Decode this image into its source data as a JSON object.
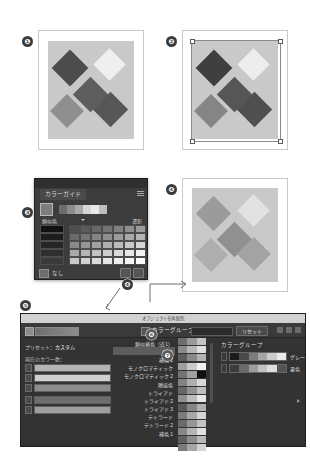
{
  "figure": {
    "callouts": [
      {
        "id": "1",
        "glyph": "❶"
      },
      {
        "id": "2",
        "glyph": "❷"
      },
      {
        "id": "3",
        "glyph": "❸"
      },
      {
        "id": "4",
        "glyph": "❹"
      },
      {
        "id": "5",
        "glyph": "❺"
      },
      {
        "id": "6",
        "glyph": "❻"
      },
      {
        "id": "7",
        "glyph": "❼"
      }
    ]
  },
  "artboards": [
    {
      "name": "artboard-original",
      "callout": "❶",
      "background": "#c9c9c9",
      "selected": false,
      "diamonds": [
        {
          "color": "#4c4c4c"
        },
        {
          "color": "#efefef"
        },
        {
          "color": "#5e5e5e"
        },
        {
          "color": "#8f8f8f"
        },
        {
          "color": "#575757"
        }
      ]
    },
    {
      "name": "artboard-selected",
      "callout": "❷",
      "background": "#c9c9c9",
      "selected": true,
      "diamonds": [
        {
          "color": "#3f3f3f"
        },
        {
          "color": "#ededed"
        },
        {
          "color": "#565656"
        },
        {
          "color": "#858585"
        },
        {
          "color": "#4f4f4f"
        }
      ]
    },
    {
      "name": "artboard-recolored",
      "callout": "❹",
      "background": "#c9c9c9",
      "selected": false,
      "diamonds": [
        {
          "color": "#9b9b9b"
        },
        {
          "color": "#e2e2e2"
        },
        {
          "color": "#909090"
        },
        {
          "color": "#aeaeae"
        },
        {
          "color": "#a3a3a3"
        }
      ]
    }
  ],
  "color_guide": {
    "callout": "❸",
    "tab_label": "カラーガイド",
    "menu_icon": "panel-menu-icon",
    "base_swatch": "#7d7d7d",
    "active_sequence": [
      "#6d6d6d",
      "#8b8b8b",
      "#a8a8a8",
      "#d6d6d6",
      "#e8e8e8",
      "#bdbdbd"
    ],
    "harmony_label": "類似色",
    "variation_label": "濃影",
    "footer_icon": "color-group-icon",
    "footer_label": "なし",
    "footer_buttons": [
      "edit-colors-icon",
      "save-swatch-icon"
    ],
    "dark_column": [
      "#111111",
      "#1c1c1c",
      "#262626",
      "#2f2f2f",
      "#3a3a3a"
    ],
    "grid_rows": [
      [
        "#4f4f4f",
        "#5b5b5b",
        "#686868",
        "#747474",
        "#818181",
        "#8e8e8e",
        "#9a9a9a"
      ],
      [
        "#6a6a6a",
        "#767676",
        "#838383",
        "#8f8f8f",
        "#9c9c9c",
        "#a8a8a8",
        "#b5b5b5"
      ],
      [
        "#8a8a8a",
        "#969696",
        "#a3a3a3",
        "#afafaf",
        "#bcbcbc",
        "#c8c8c8",
        "#d5d5d5"
      ],
      [
        "#a9a9a9",
        "#b6b6b6",
        "#c2c2c2",
        "#cfcfcf",
        "#dbdbdb",
        "#e8e8e8",
        "#f2f2f2"
      ],
      [
        "#c7c7c7",
        "#d2d2d2",
        "#dcdcdc",
        "#e5e5e5",
        "#eeeeee",
        "#f4f4f4",
        "#fafafa"
      ]
    ]
  },
  "dialog": {
    "callout": "❺",
    "title": "オブジェクトを再配色",
    "toolbar": {
      "swatch_icon": "current-color-icon",
      "checkbox_callout": "❻",
      "color_group_label": "カラーグループ",
      "field_value": "",
      "reset_label": "リセット",
      "icons": [
        "warning-icon",
        "compare-icon",
        "panel-menu-icon"
      ]
    },
    "left_panel": {
      "preset_label": "プリセット：",
      "preset_value": "カスタム",
      "current_colors_label": "現在のカラー数：",
      "rows": [
        {
          "color": "#b4b4b4"
        },
        {
          "color": "#cfcfcf"
        },
        {
          "color": "#8d8d8d"
        },
        {
          "color": "#6d6d6d"
        },
        {
          "color": "#9e9e9e"
        }
      ]
    },
    "harmony_list": {
      "callout": "❼",
      "items": [
        {
          "label": "類似横色（近1）",
          "selected": false
        },
        {
          "label": "補色",
          "selected": true
        },
        {
          "label": "補色 2",
          "selected": false
        },
        {
          "label": "モノクロマティック",
          "selected": false
        },
        {
          "label": "モノクロマティック 2",
          "selected": false
        },
        {
          "label": "隣接色",
          "selected": false
        },
        {
          "label": "トライアド",
          "selected": false
        },
        {
          "label": "トライアド 2",
          "selected": false
        },
        {
          "label": "トライアド 3",
          "selected": false
        },
        {
          "label": "テトラード",
          "selected": false
        },
        {
          "label": "テトラード 2",
          "selected": false
        },
        {
          "label": "補色 1",
          "selected": false
        }
      ]
    },
    "strip_column": {
      "header": "色相",
      "rows": [
        [
          "#6e6e6e",
          "#9a9a9a",
          "#c4c4c4"
        ],
        [
          "#8a8a8a",
          "#b6b6b6",
          "#e0e0e0"
        ],
        [
          "#5c5c5c",
          "#888888",
          "#b2b2b2"
        ],
        [
          "#9e9e9e",
          "#cacaca",
          "#f0f0f0"
        ],
        [
          "#747474",
          "#a0a0a0",
          "#111111"
        ],
        [
          "#828282",
          "#aeaeae",
          "#d8d8d8"
        ],
        [
          "#666666",
          "#929292",
          "#bebebe"
        ],
        [
          "#909090",
          "#bcbcbc",
          "#e8e8e8"
        ],
        [
          "#5a5a5a",
          "#868686",
          "#b0b0b0"
        ],
        [
          "#7c7c7c",
          "#a8a8a8",
          "#d4d4d4"
        ],
        [
          "#6a6a6a",
          "#969696",
          "#c2c2c2"
        ],
        [
          "#888888",
          "#b4b4b4",
          "#e0e0e0"
        ],
        [
          "#606060",
          "#8c8c8c",
          "#b8b8b8"
        ],
        [
          "#7a7a7a",
          "#a6a6a6",
          "#d2d2d2"
        ]
      ]
    },
    "right_panel": {
      "header": "カラーグループ",
      "groups": [
        {
          "label": "グレー",
          "ramp": [
            "#1a1a1a",
            "#4a4a4a",
            "#7c7c7c",
            "#a6a6a6",
            "#cccccc",
            "#ebebeb"
          ]
        },
        {
          "label": "暑色",
          "ramp": [
            "#3c3c3c",
            "#6a6a6a",
            "#9c9c9c",
            "#c2c2c2",
            "#dedede",
            "#555555"
          ]
        }
      ]
    }
  }
}
